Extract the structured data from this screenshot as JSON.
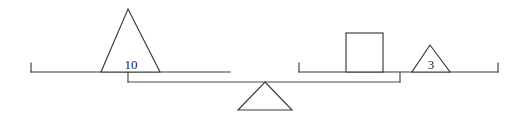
{
  "figure": {
    "background_color": "#ffffff",
    "stroke_color": "#3a3a3a",
    "label_color": "#1c1c1c"
  },
  "balance": {
    "fulcrum": {
      "name": "fulcrum-triangle",
      "label": "",
      "apex_x": 265,
      "apex_y": 82,
      "base_left_x": 238,
      "base_right_x": 292,
      "base_y": 110
    },
    "beam": {
      "name": "balance-beam",
      "left_x": 128,
      "right_x": 400,
      "y": 82,
      "left_pan_drop_y": 72,
      "right_pan_drop_y": 72
    },
    "pans": [
      {
        "side": "left",
        "name": "left-pan",
        "line_y": 72,
        "start_x": 31,
        "end_x": 230,
        "tick_x": 31,
        "tick_top_y": 63,
        "connector_x": 128,
        "items": [
          {
            "shape": "triangle",
            "name": "left-triangle-weight",
            "label": "10",
            "apex_x": 128,
            "apex_y": 9,
            "base_left_x": 101,
            "base_right_x": 160,
            "base_y": 72,
            "label_x": 131,
            "label_y": 69
          }
        ]
      },
      {
        "side": "right",
        "name": "right-pan",
        "line_y": 72,
        "start_x": 299,
        "end_x": 498,
        "tick_x": 498,
        "tick_top_y": 63,
        "left_tick_x": 299,
        "connector_x": 400,
        "items": [
          {
            "shape": "square",
            "name": "right-square-weight",
            "label": "",
            "left_x": 346,
            "right_x": 383,
            "top_y": 33,
            "bottom_y": 72
          },
          {
            "shape": "triangle",
            "name": "right-triangle-weight",
            "label": "3",
            "apex_x": 430,
            "apex_y": 45,
            "base_left_x": 412,
            "base_right_x": 450,
            "base_y": 72,
            "label_x": 431,
            "label_y": 69
          }
        ]
      }
    ]
  },
  "labels": {
    "left_weight": "10",
    "right_weight": "3"
  }
}
